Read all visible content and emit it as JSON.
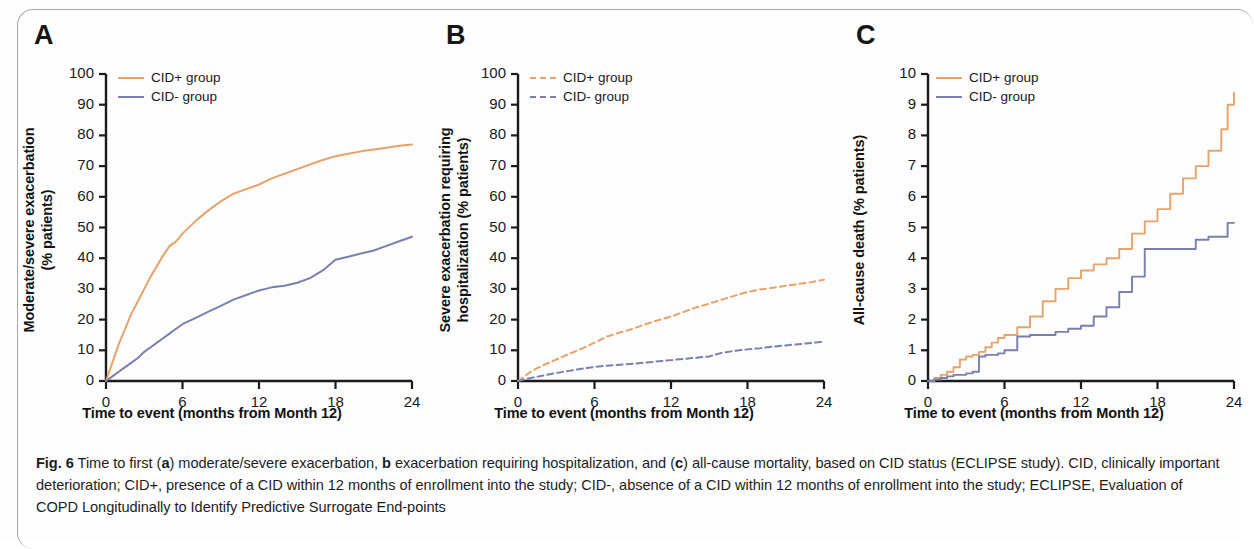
{
  "figure": {
    "panels": [
      {
        "letter": "A",
        "ylabel_lines": [
          "Moderate/severe exacerbation",
          "(% patients)"
        ],
        "xlabel": "Time to event (months from Month 12)",
        "legend": [
          {
            "label": "CID+ group",
            "color": "#E8A36B",
            "style": "solid"
          },
          {
            "label": "CID- group",
            "color": "#7B7FB0",
            "style": "solid"
          }
        ]
      },
      {
        "letter": "B",
        "ylabel_lines": [
          "Severe exacerbation requiring",
          "hospitalization (% patients)"
        ],
        "xlabel": "Time to event (months from Month 12)",
        "legend": [
          {
            "label": "CID+ group",
            "color": "#E8A36B",
            "style": "dashed"
          },
          {
            "label": "CID- group",
            "color": "#7B7FB0",
            "style": "dashed"
          }
        ]
      },
      {
        "letter": "C",
        "ylabel_lines": [
          "All-cause death (% patients)"
        ],
        "xlabel": "Time to event (months from Month 12)",
        "legend": [
          {
            "label": "CID+ group",
            "color": "#E8A36B",
            "style": "solid"
          },
          {
            "label": "CID- group",
            "color": "#7B7FB0",
            "style": "solid"
          }
        ]
      }
    ],
    "caption": {
      "fig_number": "Fig. 6",
      "text_parts": [
        {
          "t": "Fig. 6",
          "b": true
        },
        {
          "t": " Time to first (",
          "b": false
        },
        {
          "t": "a",
          "b": true
        },
        {
          "t": ") moderate/severe exacerbation, ",
          "b": false
        },
        {
          "t": "b",
          "b": true
        },
        {
          "t": " exacerbation requiring hospitalization, and (",
          "b": false
        },
        {
          "t": "c",
          "b": true
        },
        {
          "t": ") all-cause mortality, based on CID status (ECLIPSE study)",
          "b": false
        },
        {
          "t": ". CID, clinically important deterioration; CID+, presence of a CID within 12 months of enrollment into the study; CID-, absence of a CID within 12 months of enrollment into the study; ECLIPSE, Evaluation of COPD Longitudinally to Identify Predictive Surrogate End-points",
          "b": false
        }
      ]
    }
  },
  "chart_data": [
    {
      "type": "line",
      "panel": "A",
      "title": "Time to first moderate/severe exacerbation",
      "xlabel": "Time to event (months from Month 12)",
      "ylabel": "Moderate/severe exacerbation (% patients)",
      "xlim": [
        0,
        24
      ],
      "ylim": [
        0,
        100
      ],
      "xticks": [
        0,
        6,
        12,
        18,
        24
      ],
      "yticks": [
        0,
        10,
        20,
        30,
        40,
        50,
        60,
        70,
        80,
        90,
        100
      ],
      "grid": false,
      "legend_position": "top-left",
      "x": [
        0,
        0.5,
        1,
        1.5,
        2,
        2.5,
        3,
        3.5,
        4,
        4.5,
        5,
        5.5,
        6,
        7,
        8,
        9,
        10,
        11,
        12,
        13,
        14,
        15,
        16,
        17,
        18,
        19,
        20,
        21,
        22,
        23,
        24
      ],
      "series": [
        {
          "name": "CID+ group",
          "color": "#E8A36B",
          "style": "solid",
          "values": [
            0,
            6,
            12,
            17,
            22,
            26,
            30,
            34,
            37.5,
            41,
            44,
            45.5,
            48,
            52,
            55.5,
            58.5,
            61,
            62.5,
            64,
            66,
            67.5,
            69,
            70.5,
            72,
            73.2,
            74,
            74.8,
            75.4,
            76,
            76.6,
            77
          ]
        },
        {
          "name": "CID- group",
          "color": "#7B7FB0",
          "style": "solid",
          "values": [
            0,
            1.5,
            3,
            4.5,
            6,
            7.5,
            9.5,
            11,
            12.5,
            14,
            15.5,
            17,
            18.5,
            20.5,
            22.5,
            24.5,
            26.5,
            28,
            29.5,
            30.5,
            31,
            32,
            33.5,
            36,
            39.5,
            40.5,
            41.5,
            42.5,
            44,
            45.5,
            47
          ]
        }
      ]
    },
    {
      "type": "line",
      "panel": "B",
      "title": "Time to first severe exacerbation requiring hospitalization",
      "xlabel": "Time to event (months from Month 12)",
      "ylabel": "Severe exacerbation requiring hospitalization (% patients)",
      "xlim": [
        0,
        24
      ],
      "ylim": [
        0,
        100
      ],
      "xticks": [
        0,
        6,
        12,
        18,
        24
      ],
      "yticks": [
        0,
        10,
        20,
        30,
        40,
        50,
        60,
        70,
        80,
        90,
        100
      ],
      "grid": false,
      "legend_position": "top-left",
      "x": [
        0,
        0.5,
        1,
        1.5,
        2,
        3,
        4,
        5,
        6,
        7,
        8,
        9,
        10,
        11,
        12,
        13,
        14,
        15,
        16,
        17,
        18,
        19,
        20,
        21,
        22,
        23,
        24
      ],
      "series": [
        {
          "name": "CID+ group",
          "color": "#E8A36B",
          "style": "dashed",
          "values": [
            0,
            1.5,
            3,
            4.2,
            5.2,
            7,
            8.8,
            10.5,
            12.5,
            14.5,
            15.8,
            17,
            18.5,
            19.8,
            21,
            22.5,
            24,
            25.2,
            26.5,
            27.8,
            29,
            29.8,
            30.4,
            31,
            31.6,
            32.2,
            33
          ]
        },
        {
          "name": "CID- group",
          "color": "#7B7FB0",
          "style": "dashed",
          "values": [
            0,
            0.5,
            1,
            1.4,
            1.8,
            2.6,
            3.3,
            4,
            4.6,
            5,
            5.3,
            5.6,
            6,
            6.4,
            6.8,
            7.2,
            7.6,
            8,
            9.2,
            9.8,
            10.3,
            10.7,
            11.2,
            11.6,
            12,
            12.4,
            12.8
          ]
        }
      ]
    },
    {
      "type": "line",
      "panel": "C",
      "title": "Time to all-cause mortality",
      "xlabel": "Time to event (months from Month 12)",
      "ylabel": "All-cause death (% patients)",
      "xlim": [
        0,
        24
      ],
      "ylim": [
        0,
        10
      ],
      "xticks": [
        0,
        6,
        12,
        18,
        24
      ],
      "yticks": [
        0,
        1,
        2,
        3,
        4,
        5,
        6,
        7,
        8,
        9,
        10
      ],
      "grid": false,
      "legend_position": "top-left",
      "step": true,
      "x": [
        0,
        0.5,
        1,
        1.5,
        2,
        2.5,
        3,
        3.5,
        4,
        4.5,
        5,
        5.5,
        6,
        7,
        8,
        9,
        10,
        11,
        12,
        13,
        14,
        15,
        16,
        17,
        18,
        19,
        20,
        21,
        22,
        23,
        23.5,
        24
      ],
      "series": [
        {
          "name": "CID+ group",
          "color": "#E8A36B",
          "style": "solid",
          "values": [
            0,
            0.1,
            0.2,
            0.3,
            0.45,
            0.7,
            0.8,
            0.85,
            0.95,
            1.1,
            1.25,
            1.4,
            1.5,
            1.75,
            2.1,
            2.6,
            3.0,
            3.35,
            3.6,
            3.8,
            4.0,
            4.3,
            4.8,
            5.2,
            5.6,
            6.1,
            6.6,
            7.0,
            7.5,
            8.2,
            9.0,
            9.4
          ]
        },
        {
          "name": "CID- group",
          "color": "#7B7FB0",
          "style": "solid",
          "values": [
            0,
            0.05,
            0.1,
            0.15,
            0.2,
            0.2,
            0.25,
            0.3,
            0.8,
            0.85,
            0.85,
            0.9,
            1.0,
            1.45,
            1.5,
            1.5,
            1.6,
            1.7,
            1.8,
            2.1,
            2.4,
            2.9,
            3.4,
            4.3,
            4.3,
            4.3,
            4.3,
            4.6,
            4.7,
            4.7,
            5.15,
            5.15
          ]
        }
      ]
    }
  ]
}
